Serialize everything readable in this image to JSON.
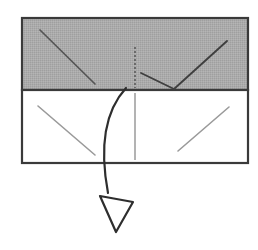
{
  "figure": {
    "type": "line-diagram",
    "canvas": {
      "width": 258,
      "height": 250,
      "background": "#ffffff"
    },
    "colors": {
      "shaded_fill": "#a9a9a9",
      "outline": "#3a3a3a",
      "crease_dark": "#555555",
      "crease_light": "#9a9a9a",
      "arrow": "#2e2e2e",
      "paper_white": "#ffffff"
    },
    "shapes": {
      "shaded_panel": {
        "label": "upper shaded panel",
        "x": 22,
        "y": 18,
        "width": 226,
        "height": 72,
        "fill": "#a9a9a9",
        "stroke": "#3a3a3a",
        "stroke_width": 2.2
      },
      "white_panel": {
        "label": "lower white panel",
        "x": 22,
        "y": 90,
        "width": 226,
        "height": 73,
        "fill": "#ffffff",
        "stroke": "#3a3a3a",
        "stroke_width": 2.2
      }
    },
    "creases": [
      {
        "name": "upper-left-diagonal",
        "x1": 40,
        "y1": 30,
        "x2": 95,
        "y2": 84,
        "color": "#555555",
        "width": 1.7,
        "dash": "none"
      },
      {
        "name": "upper-center-dashed-vertical",
        "x1": 135,
        "y1": 47,
        "x2": 135,
        "y2": 88,
        "color": "#555555",
        "width": 1.5,
        "dash": "2,2"
      },
      {
        "name": "upper-v-left-arm",
        "x1": 141,
        "y1": 73,
        "x2": 174,
        "y2": 89,
        "color": "#3f3f3f",
        "width": 1.9,
        "dash": "none"
      },
      {
        "name": "upper-v-right-arm",
        "x1": 174,
        "y1": 89,
        "x2": 227,
        "y2": 41,
        "color": "#3f3f3f",
        "width": 1.9,
        "dash": "none"
      },
      {
        "name": "lower-left-diagonal",
        "x1": 38,
        "y1": 106,
        "x2": 95,
        "y2": 155,
        "color": "#9a9a9a",
        "width": 1.6,
        "dash": "none"
      },
      {
        "name": "lower-center-vertical",
        "x1": 135,
        "y1": 93,
        "x2": 135,
        "y2": 160,
        "color": "#9a9a9a",
        "width": 1.5,
        "dash": "none"
      },
      {
        "name": "lower-right-diagonal",
        "x1": 178,
        "y1": 151,
        "x2": 229,
        "y2": 107,
        "color": "#9a9a9a",
        "width": 1.6,
        "dash": "none"
      }
    ],
    "arrow": {
      "name": "fold-down-arrow",
      "direction": "down",
      "style": "curved-with-hollow-head",
      "path": "M 126 88 C 104 112, 100 150, 108 193",
      "stroke": "#2e2e2e",
      "stroke_width": 2.2,
      "head": {
        "points": "100,196 133,202 116,232",
        "fill": "#ffffff",
        "stroke": "#2e2e2e",
        "stroke_width": 2.2
      }
    }
  }
}
